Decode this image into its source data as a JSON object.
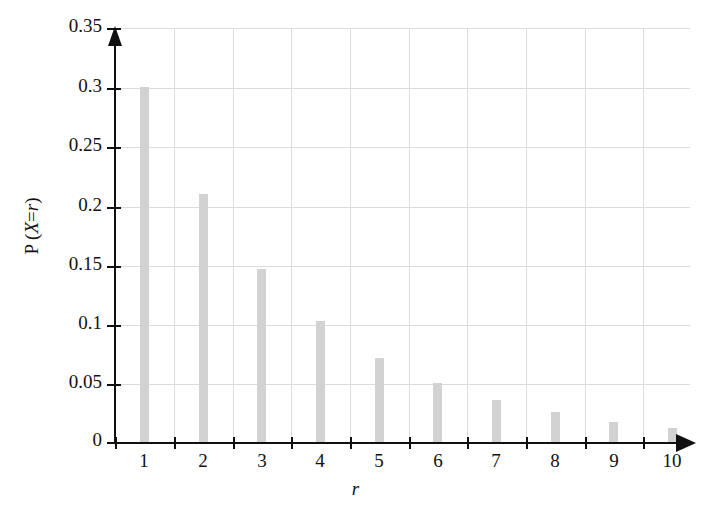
{
  "chart_data": {
    "type": "bar",
    "title": "",
    "subtitle": "",
    "xlabel": "r",
    "ylabel": "P (X=r)",
    "ylabel_parts": {
      "prefix": "P (",
      "variable": "X",
      "operator": "=",
      "index": "r",
      "suffix": ")"
    },
    "categories": [
      "1",
      "2",
      "3",
      "4",
      "5",
      "6",
      "7",
      "8",
      "9",
      "10"
    ],
    "values": [
      0.3,
      0.21,
      0.147,
      0.103,
      0.072,
      0.051,
      0.036,
      0.026,
      0.018,
      0.013
    ],
    "series": [
      {
        "name": "P(X=r)",
        "values": [
          0.3,
          0.21,
          0.147,
          0.103,
          0.072,
          0.051,
          0.036,
          0.026,
          0.018,
          0.013
        ]
      }
    ],
    "xlim": [
      0.5,
      10.5
    ],
    "ylim": [
      0,
      0.35
    ],
    "ytick_labels": [
      "0.35",
      "0.3",
      "0.25",
      "0.2",
      "0.15",
      "0.1",
      "0.05",
      "0"
    ],
    "ytick_values": [
      0.35,
      0.3,
      0.25,
      0.2,
      0.15,
      0.1,
      0.05,
      0
    ],
    "xtick_labels": [
      "1",
      "2",
      "3",
      "4",
      "5",
      "6",
      "7",
      "8",
      "9",
      "10"
    ],
    "grid": true,
    "grid_color": "#dcdcdc",
    "bar_color": "#d2d2d2",
    "axis_color": "#101010",
    "legend": null,
    "legend_position": "none",
    "annotations": []
  }
}
